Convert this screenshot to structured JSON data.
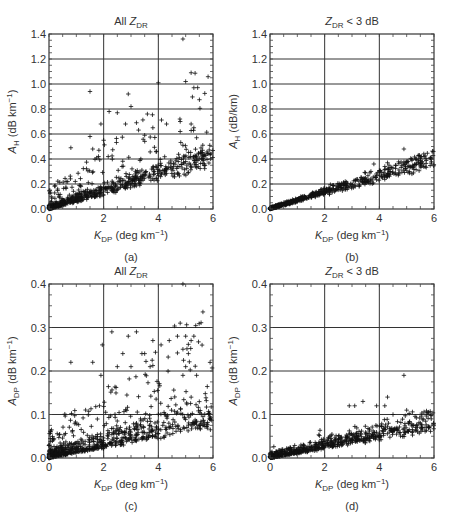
{
  "figure": {
    "panels": [
      {
        "id": "a",
        "label": "(a)",
        "title_main": "All Z",
        "title_sub": "DR",
        "title_rest": "",
        "ylabel_main": "A",
        "ylabel_sub": "H",
        "ylabel_rest": " (dB km",
        "ylabel_sup": "−1",
        "ylabel_close": ")",
        "xlabel_main": "K",
        "xlabel_sub": "DP",
        "xlabel_rest": " (deg km",
        "xlabel_sup": "−1",
        "xlabel_close": ")"
      },
      {
        "id": "b",
        "label": "(b)",
        "title_main": "Z",
        "title_sub": "DR",
        "title_rest": " < 3 dB",
        "ylabel_main": "A",
        "ylabel_sub": "H",
        "ylabel_rest": " (dB/km)",
        "ylabel_sup": "",
        "ylabel_close": "",
        "xlabel_main": "K",
        "xlabel_sub": "DP",
        "xlabel_rest": " (deg km",
        "xlabel_sup": "−1",
        "xlabel_close": ")"
      },
      {
        "id": "c",
        "label": "(c)",
        "title_main": "All Z",
        "title_sub": "DR",
        "title_rest": "",
        "ylabel_main": "A",
        "ylabel_sub": "DP",
        "ylabel_rest": " (dB km",
        "ylabel_sup": "−1",
        "ylabel_close": ")",
        "xlabel_main": "K",
        "xlabel_sub": "DP",
        "xlabel_rest": " (deg km",
        "xlabel_sup": "−1",
        "xlabel_close": ")"
      },
      {
        "id": "d",
        "label": "(d)",
        "title_main": "Z",
        "title_sub": "DR",
        "title_rest": " < 3 dB",
        "ylabel_main": "A",
        "ylabel_sub": "DP",
        "ylabel_rest": " (dB km",
        "ylabel_sup": "−1",
        "ylabel_close": ")",
        "xlabel_main": "K",
        "xlabel_sub": "DP",
        "xlabel_rest": " (deg km",
        "xlabel_sup": "−1",
        "xlabel_close": ")"
      }
    ]
  },
  "chart_data": [
    {
      "type": "scatter",
      "panel": "(a)",
      "title": "All ZDR",
      "xlabel": "KDP (deg km-1)",
      "ylabel": "AH (dB km-1)",
      "xlim": [
        0,
        6
      ],
      "ylim": [
        0,
        1.4
      ],
      "xticks": [
        "0",
        "2",
        "4",
        "6"
      ],
      "yticks": [
        "0.0",
        "0.2",
        "0.4",
        "0.6",
        "0.8",
        "1.0",
        "1.2",
        "1.4"
      ],
      "grid": true,
      "marker": "+",
      "trend": {
        "slope": 0.065,
        "spread": 0.09,
        "n": 700,
        "outlier_rate": 0.22,
        "outlier_max": 0.55
      },
      "outliers": [
        [
          1.5,
          0.94
        ],
        [
          2.9,
          0.92
        ],
        [
          3.0,
          0.82
        ],
        [
          4.0,
          1.01
        ],
        [
          4.9,
          1.36
        ],
        [
          5.2,
          1.09
        ],
        [
          5.0,
          1.02
        ],
        [
          5.3,
          0.97
        ],
        [
          2.2,
          0.78
        ],
        [
          2.5,
          0.77
        ],
        [
          3.6,
          0.76
        ],
        [
          4.3,
          0.68
        ],
        [
          1.9,
          0.68
        ],
        [
          2.8,
          0.68
        ],
        [
          3.2,
          0.69
        ],
        [
          4.8,
          0.7
        ],
        [
          5.2,
          0.68
        ],
        [
          5.3,
          0.65
        ],
        [
          0.8,
          0.49
        ],
        [
          1.5,
          0.58
        ],
        [
          3.5,
          0.59
        ],
        [
          5.4,
          0.57
        ],
        [
          4.8,
          0.62
        ],
        [
          4.9,
          0.51
        ],
        [
          3.8,
          0.65
        ],
        [
          1.6,
          0.48
        ],
        [
          2.0,
          0.55
        ]
      ]
    },
    {
      "type": "scatter",
      "panel": "(b)",
      "title": "ZDR < 3 dB",
      "xlabel": "KDP (deg km-1)",
      "ylabel": "AH (dB/km)",
      "xlim": [
        0,
        6
      ],
      "ylim": [
        0,
        1.4
      ],
      "xticks": [
        "0",
        "2",
        "4",
        "6"
      ],
      "yticks": [
        "0.0",
        "0.2",
        "0.4",
        "0.6",
        "0.8",
        "1.0",
        "1.2",
        "1.4"
      ],
      "grid": true,
      "marker": "+",
      "trend": {
        "slope": 0.065,
        "spread": 0.035,
        "n": 600,
        "outlier_rate": 0.0,
        "outlier_max": 0.0
      },
      "outliers": [
        [
          4.9,
          0.48
        ],
        [
          4.3,
          0.37
        ],
        [
          5.0,
          0.37
        ],
        [
          5.9,
          0.4
        ],
        [
          5.6,
          0.36
        ],
        [
          3.8,
          0.36
        ],
        [
          4.2,
          0.34
        ]
      ]
    },
    {
      "type": "scatter",
      "panel": "(c)",
      "title": "All ZDR",
      "xlabel": "KDP (deg km-1)",
      "ylabel": "ADP (dB km-1)",
      "xlim": [
        0,
        6
      ],
      "ylim": [
        0,
        0.4
      ],
      "xticks": [
        "0",
        "2",
        "4",
        "6"
      ],
      "yticks": [
        "0.0",
        "0.1",
        "0.2",
        "0.3",
        "0.4"
      ],
      "grid": true,
      "marker": "+",
      "trend": {
        "slope": 0.013,
        "spread": 0.045,
        "n": 750,
        "outlier_rate": 0.25,
        "outlier_max": 0.2
      },
      "outliers": [
        [
          0.8,
          0.22
        ],
        [
          1.6,
          0.22
        ],
        [
          1.95,
          0.26
        ],
        [
          2.3,
          0.29
        ],
        [
          2.9,
          0.28
        ],
        [
          3.2,
          0.29
        ],
        [
          4.8,
          0.31
        ],
        [
          4.9,
          0.4
        ],
        [
          4.7,
          0.28
        ],
        [
          5.0,
          0.28
        ],
        [
          5.3,
          0.28
        ],
        [
          5.2,
          0.27
        ],
        [
          4.1,
          0.26
        ],
        [
          4.4,
          0.27
        ],
        [
          3.8,
          0.27
        ],
        [
          5.1,
          0.24
        ],
        [
          5.0,
          0.21
        ],
        [
          5.4,
          0.19
        ],
        [
          4.9,
          0.25
        ],
        [
          3.4,
          0.24
        ],
        [
          3.5,
          0.24
        ],
        [
          2.7,
          0.24
        ],
        [
          2.5,
          0.21
        ],
        [
          3.7,
          0.21
        ],
        [
          4.9,
          0.19
        ],
        [
          1.9,
          0.19
        ],
        [
          3.0,
          0.21
        ]
      ]
    },
    {
      "type": "scatter",
      "panel": "(d)",
      "title": "ZDR < 3 dB",
      "xlabel": "KDP (deg km-1)",
      "ylabel": "ADP (dB km-1)",
      "xlim": [
        0,
        6
      ],
      "ylim": [
        0,
        0.4
      ],
      "xticks": [
        "0",
        "2",
        "4",
        "6"
      ],
      "yticks": [
        "0.0",
        "0.1",
        "0.2",
        "0.3",
        "0.4"
      ],
      "grid": true,
      "marker": "+",
      "trend": {
        "slope": 0.012,
        "spread": 0.03,
        "n": 650,
        "outlier_rate": 0.05,
        "outlier_max": 0.06
      },
      "outliers": [
        [
          4.9,
          0.19
        ],
        [
          4.3,
          0.14
        ],
        [
          3.4,
          0.13
        ],
        [
          3.9,
          0.12
        ],
        [
          4.2,
          0.12
        ],
        [
          3.1,
          0.12
        ],
        [
          2.9,
          0.12
        ],
        [
          5.0,
          0.11
        ],
        [
          4.5,
          0.1
        ],
        [
          5.9,
          0.09
        ],
        [
          5.6,
          0.09
        ],
        [
          5.5,
          0.08
        ],
        [
          5.8,
          0.07
        ],
        [
          5.4,
          0.06
        ]
      ]
    }
  ]
}
